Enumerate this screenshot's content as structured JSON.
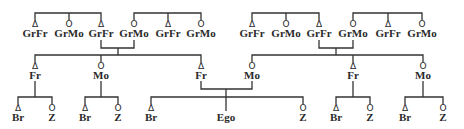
{
  "diagram": {
    "type": "kinship-chart",
    "symbols": {
      "male": "Δ",
      "female": "O"
    },
    "line_color": "#333333",
    "grandparents": [
      {
        "label": "GrFr",
        "sex": "male"
      },
      {
        "label": "GrMo",
        "sex": "female"
      },
      {
        "label": "GrFr",
        "sex": "male"
      },
      {
        "label": "GrMo",
        "sex": "female"
      },
      {
        "label": "GrFr",
        "sex": "male"
      },
      {
        "label": "GrMo",
        "sex": "female"
      },
      {
        "label": "GrFr",
        "sex": "male"
      },
      {
        "label": "GrMo",
        "sex": "female"
      },
      {
        "label": "GrFr",
        "sex": "male"
      },
      {
        "label": "GrMo",
        "sex": "female"
      },
      {
        "label": "GrFr",
        "sex": "male"
      },
      {
        "label": "GrMo",
        "sex": "female"
      }
    ],
    "parents": [
      {
        "label": "Fr",
        "sex": "male"
      },
      {
        "label": "Mo",
        "sex": "female"
      },
      {
        "label": "Fr",
        "sex": "male"
      },
      {
        "label": "Mo",
        "sex": "female"
      },
      {
        "label": "Fr",
        "sex": "male"
      },
      {
        "label": "Mo",
        "sex": "female"
      }
    ],
    "children": [
      {
        "label": "Br",
        "sex": "male"
      },
      {
        "label": "Z",
        "sex": "female"
      },
      {
        "label": "Br",
        "sex": "male"
      },
      {
        "label": "Z",
        "sex": "female"
      },
      {
        "label": "Br",
        "sex": "male"
      },
      {
        "label": "Ego",
        "sex": ""
      },
      {
        "label": "Z",
        "sex": "female"
      },
      {
        "label": "Br",
        "sex": "male"
      },
      {
        "label": "Z",
        "sex": "female"
      },
      {
        "label": "Br",
        "sex": "male"
      },
      {
        "label": "Z",
        "sex": "female"
      }
    ]
  }
}
